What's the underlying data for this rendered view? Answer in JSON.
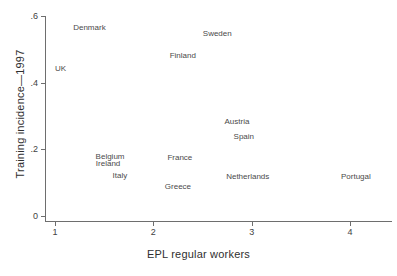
{
  "chart_data": {
    "type": "scatter",
    "title": "",
    "xlabel": "EPL regular workers",
    "ylabel": "Training incidence—1997",
    "xlim": [
      0.78,
      4.32
    ],
    "ylim": [
      0,
      0.62
    ],
    "xticks": [
      "1",
      "2",
      "3",
      "4"
    ],
    "xtick_values": [
      1,
      2,
      3,
      4
    ],
    "yticks": [
      ".6",
      ".4",
      ".2",
      "0"
    ],
    "ytick_values": [
      0.6,
      0.4,
      0.2,
      0
    ],
    "grid": false,
    "legend": null,
    "markers": "labels-only",
    "points": [
      {
        "label": "Denmark",
        "x": 1.35,
        "y": 0.565,
        "anchor": "center"
      },
      {
        "label": "UK",
        "x": 1.0,
        "y": 0.44,
        "anchor": "left"
      },
      {
        "label": "Sweden",
        "x": 2.65,
        "y": 0.545,
        "anchor": "center"
      },
      {
        "label": "Finland",
        "x": 2.3,
        "y": 0.48,
        "anchor": "center"
      },
      {
        "label": "Austria",
        "x": 2.85,
        "y": 0.282,
        "anchor": "center"
      },
      {
        "label": "Spain",
        "x": 2.92,
        "y": 0.237,
        "anchor": "center"
      },
      {
        "label": "Belgium",
        "x": 1.56,
        "y": 0.177,
        "anchor": "center"
      },
      {
        "label": "France",
        "x": 2.27,
        "y": 0.174,
        "anchor": "center"
      },
      {
        "label": "Ireland",
        "x": 1.54,
        "y": 0.155,
        "anchor": "center"
      },
      {
        "label": "Italy",
        "x": 1.66,
        "y": 0.12,
        "anchor": "center"
      },
      {
        "label": "Netherlands",
        "x": 2.96,
        "y": 0.117,
        "anchor": "center"
      },
      {
        "label": "Portugal",
        "x": 4.06,
        "y": 0.117,
        "anchor": "center"
      },
      {
        "label": "Greece",
        "x": 2.25,
        "y": 0.086,
        "anchor": "center"
      }
    ]
  }
}
